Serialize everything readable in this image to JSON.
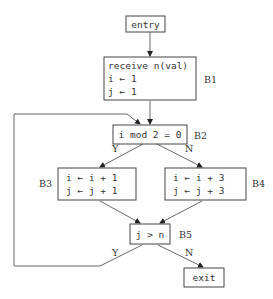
{
  "diagram": {
    "type": "control-flow-graph",
    "nodes": {
      "entry": {
        "text": "entry"
      },
      "b1": {
        "label": "B1",
        "lines": [
          "receive n(val)",
          "i ← 1",
          "j ← 1"
        ]
      },
      "b2": {
        "label": "B2",
        "lines": [
          "i mod 2 = 0"
        ]
      },
      "b3": {
        "label": "B3",
        "lines": [
          "i ← i + 1",
          "j ← j + 1"
        ]
      },
      "b4": {
        "label": "B4",
        "lines": [
          "i ← i + 3",
          "j ← j + 3"
        ]
      },
      "b5": {
        "label": "B5",
        "lines": [
          "j > n"
        ]
      },
      "exit": {
        "text": "exit"
      }
    },
    "edges": {
      "b2_b3": "Y",
      "b2_b4": "N",
      "b5_b2": "Y",
      "b5_exit": "N"
    }
  }
}
